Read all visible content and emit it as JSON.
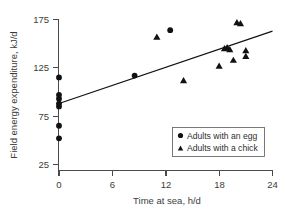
{
  "chart_data": {
    "type": "scatter",
    "title": "",
    "xlabel": "Time at sea, h/d",
    "ylabel": "Field energy expenditure, kJ/d",
    "xlim": [
      0,
      24
    ],
    "ylim": [
      25,
      175
    ],
    "xticks": [
      0,
      6,
      12,
      18,
      24
    ],
    "yticks": [
      25,
      75,
      125,
      175
    ],
    "xtick_labels": [
      "0",
      "6",
      "12",
      "18",
      "24"
    ],
    "ytick_labels": [
      "25",
      "75",
      "125",
      "175"
    ],
    "grid": false,
    "legend_position": "lower right",
    "series": [
      {
        "name": "Adults with an egg",
        "marker": "circle",
        "color": "#111111",
        "points": [
          [
            0.0,
            115.0
          ],
          [
            0.0,
            97.0
          ],
          [
            0.0,
            93.0
          ],
          [
            0.0,
            88.0
          ],
          [
            0.0,
            85.0
          ],
          [
            0.0,
            65.0
          ],
          [
            0.0,
            52.0
          ],
          [
            8.5,
            117.0
          ],
          [
            12.5,
            164.0
          ]
        ]
      },
      {
        "name": "Adults with a chick",
        "marker": "triangle",
        "color": "#111111",
        "points": [
          [
            11.0,
            157.0
          ],
          [
            14.0,
            112.0
          ],
          [
            18.0,
            127.0
          ],
          [
            18.6,
            145.0
          ],
          [
            18.9,
            146.0
          ],
          [
            19.2,
            144.0
          ],
          [
            19.6,
            133.0
          ],
          [
            20.0,
            172.0
          ],
          [
            20.4,
            171.0
          ],
          [
            21.0,
            143.0
          ],
          [
            21.0,
            137.0
          ]
        ]
      }
    ],
    "fit_line": {
      "name": "regression-line",
      "x_start": 0.0,
      "y_start": 88.0,
      "x_end": 24.0,
      "y_end": 163.0,
      "color": "#111111"
    }
  },
  "legend": {
    "items": [
      {
        "label": "Adults with an egg",
        "marker": "circle"
      },
      {
        "label": "Adults with a chick",
        "marker": "triangle"
      }
    ]
  }
}
